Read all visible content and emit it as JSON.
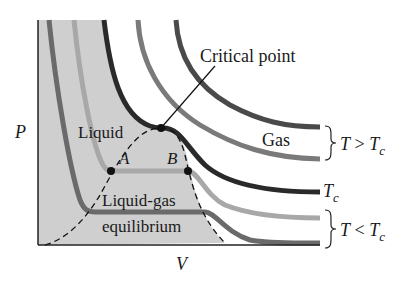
{
  "diagram": {
    "axes": {
      "y_label": "P",
      "x_label": "V"
    },
    "regions": {
      "liquid": "Liquid",
      "gas": "Gas",
      "coexistence_line1": "Liquid-gas",
      "coexistence_line2": "equilibrium"
    },
    "annotations": {
      "critical_point": "Critical point",
      "point_a": "A",
      "point_b": "B"
    },
    "isotherm_groups": {
      "above_T": "T",
      "above_op": " > ",
      "above_Tc": "T",
      "above_sub": "c",
      "critical_T": "T",
      "critical_sub": "c",
      "below_T": "T",
      "below_op": " < ",
      "below_Tc": "T",
      "below_sub": "c"
    },
    "colors": {
      "shaded_region": "#cfcfcf",
      "isotherm_high": "#4a4a4a",
      "isotherm_mid": "#7a7a7a",
      "isotherm_critical": "#2a2a2a",
      "isotherm_low_light": "#a8a8a8",
      "isotherm_low_dark": "#6a6a6a",
      "axis": "#222222"
    }
  }
}
